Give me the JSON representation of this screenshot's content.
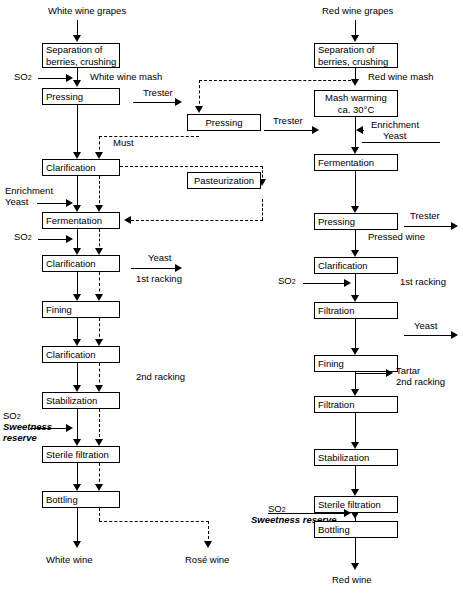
{
  "diagram": {
    "left_column": {
      "start_label": "White wine grapes",
      "end_label": "White wine",
      "boxes": [
        {
          "id": "sep",
          "label_lines": [
            "Separation of",
            "berries, crushing"
          ]
        },
        {
          "id": "press",
          "label_lines": [
            "Pressing"
          ]
        },
        {
          "id": "clar1",
          "label_lines": [
            "Clarification"
          ]
        },
        {
          "id": "ferm",
          "label_lines": [
            "Fermentation"
          ]
        },
        {
          "id": "clar2",
          "label_lines": [
            "Clarification"
          ]
        },
        {
          "id": "fin",
          "label_lines": [
            "Fining"
          ]
        },
        {
          "id": "clar3",
          "label_lines": [
            "Clarification"
          ]
        },
        {
          "id": "stab",
          "label_lines": [
            "Stabilization"
          ]
        },
        {
          "id": "ster",
          "label_lines": [
            "Sterile filtration"
          ]
        },
        {
          "id": "bot",
          "label_lines": [
            "Bottling"
          ]
        }
      ],
      "side_labels": [
        {
          "id": "so2-1",
          "text": "SO",
          "sub": "2"
        },
        {
          "id": "white-wine-mash",
          "text": "White wine mash"
        },
        {
          "id": "trester-1",
          "text": "Trester"
        },
        {
          "id": "must",
          "text": "Must"
        },
        {
          "id": "enrichment",
          "text": "Enrichment"
        },
        {
          "id": "yeast-in",
          "text": "Yeast"
        },
        {
          "id": "so2-2",
          "text": "SO",
          "sub": "2"
        },
        {
          "id": "yeast-out",
          "text": "Yeast"
        },
        {
          "id": "racking-1",
          "text": "1st racking"
        },
        {
          "id": "racking-2",
          "text": "2nd racking"
        },
        {
          "id": "so2-3",
          "text": "SO",
          "sub": "2"
        },
        {
          "id": "sweetness",
          "text": "Sweetness"
        },
        {
          "id": "reserve",
          "text": "reserve"
        }
      ]
    },
    "middle_column": {
      "boxes": [
        {
          "id": "press-mid",
          "label_lines": [
            "Pressing"
          ]
        },
        {
          "id": "past",
          "label_lines": [
            "Pasteurization"
          ]
        }
      ],
      "labels": [
        {
          "id": "trester-mid",
          "text": "Trester"
        }
      ]
    },
    "right_column": {
      "start_label": "Red wine grapes",
      "end_label": "Red wine",
      "boxes": [
        {
          "id": "rsep",
          "label_lines": [
            "Separation of",
            "berries, crushing"
          ]
        },
        {
          "id": "mash",
          "label_lines": [
            "Mash warming",
            "ca. 30°C"
          ]
        },
        {
          "id": "rferm",
          "label_lines": [
            "Fermentation"
          ]
        },
        {
          "id": "rpress",
          "label_lines": [
            "Pressing"
          ]
        },
        {
          "id": "rclar",
          "label_lines": [
            "Clarification"
          ]
        },
        {
          "id": "rfilt1",
          "label_lines": [
            "Filtration"
          ]
        },
        {
          "id": "rfin",
          "label_lines": [
            "Fining"
          ]
        },
        {
          "id": "rfilt2",
          "label_lines": [
            "Filtration"
          ]
        },
        {
          "id": "rstab",
          "label_lines": [
            "Stabilization"
          ]
        },
        {
          "id": "rster",
          "label_lines": [
            "Sterile filtration"
          ]
        },
        {
          "id": "rbot",
          "label_lines": [
            "Bottling"
          ]
        }
      ],
      "side_labels": [
        {
          "id": "red-wine-mash",
          "text": "Red wine mash"
        },
        {
          "id": "renrichment",
          "text": "Enrichment"
        },
        {
          "id": "ryeast-in",
          "text": "Yeast"
        },
        {
          "id": "rtrester",
          "text": "Trester"
        },
        {
          "id": "pressed-wine",
          "text": "Pressed wine"
        },
        {
          "id": "rso2-1",
          "text": "SO",
          "sub": "2"
        },
        {
          "id": "rracking-1",
          "text": "1st racking"
        },
        {
          "id": "ryeast-out",
          "text": "Yeast"
        },
        {
          "id": "tartar",
          "text": "Tartar"
        },
        {
          "id": "rracking-2",
          "text": "2nd racking"
        },
        {
          "id": "rso2-2",
          "text": "SO",
          "sub": "2"
        },
        {
          "id": "rsweetness",
          "text": "Sweetness reserve"
        }
      ]
    },
    "rose_output": "Rosé wine"
  }
}
